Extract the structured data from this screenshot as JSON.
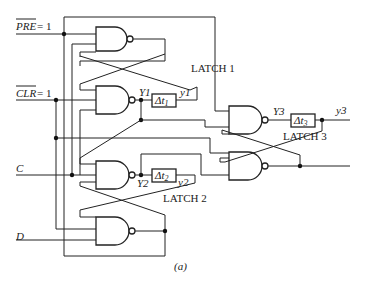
{
  "figure": {
    "caption": "(a)",
    "inputs": {
      "pre": "PRE = 1",
      "pre_name": "PRE",
      "clr": "CLR = 1",
      "clr_name": "CLR",
      "eq": " = 1",
      "c": "C",
      "d": "D"
    },
    "latches": {
      "latch1": "LATCH 1",
      "latch2": "LATCH 2",
      "latch3": "LATCH 3"
    },
    "signals": {
      "Y1": "Y1",
      "y1": "y1",
      "Y2": "Y2",
      "y2": "y2",
      "Y3": "Y3",
      "y3": "y3"
    },
    "delays": {
      "d1": "Δt",
      "d1_sub": "1",
      "d2": "Δt",
      "d2_sub": "2",
      "d3": "Δt",
      "d3_sub": "3"
    }
  }
}
